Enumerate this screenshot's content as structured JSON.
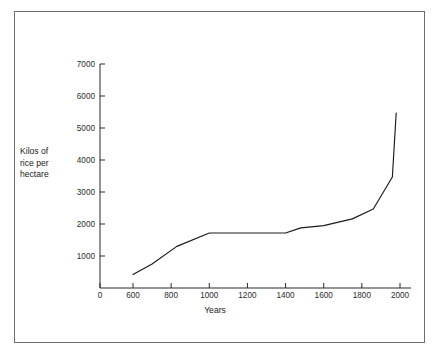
{
  "figure": {
    "background_color": "#ffffff",
    "frame_color": "#6d6d6d",
    "line_color": "#1a1a1a",
    "axis_color": "#2b2b2b"
  },
  "ylabel": {
    "line1": "Kilos of",
    "line2": "rice per",
    "line3": "hectare"
  },
  "chart_data": {
    "type": "line",
    "title": "",
    "subtitle": "",
    "xlabel": "Years",
    "ylabel": "Kilos of rice per hectare",
    "xlim": [
      0,
      2100
    ],
    "ylim": [
      0,
      7000
    ],
    "grid": false,
    "legend": "none",
    "xticks": [
      0,
      600,
      800,
      1000,
      1200,
      1400,
      1600,
      1800,
      2000
    ],
    "xtick_labels": [
      "0",
      "600",
      "800",
      "1000",
      "1200",
      "1400",
      "1600",
      "1800",
      "2000"
    ],
    "yticks": [
      1000,
      2000,
      3000,
      4000,
      5000,
      6000,
      7000
    ],
    "ytick_labels": [
      "1000",
      "2000",
      "3000",
      "4000",
      "5000",
      "6000",
      "7000"
    ],
    "x_axis_break_after": 0,
    "series": [
      {
        "name": "Rice yield",
        "x": [
          600,
          700,
          830,
          1000,
          1400,
          1480,
          1600,
          1750,
          1860,
          1960,
          1980
        ],
        "y": [
          420,
          750,
          1300,
          1720,
          1720,
          1880,
          1950,
          2160,
          2470,
          3470,
          5470
        ]
      }
    ]
  }
}
